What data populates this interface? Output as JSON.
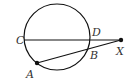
{
  "diagram": {
    "type": "circle-secant-geometry",
    "circle": {
      "cx": 57,
      "cy": 37,
      "r": 33
    },
    "points": {
      "C": {
        "label": "C",
        "x": 24,
        "y": 40,
        "lx": 16,
        "ly": 44
      },
      "D": {
        "label": "D",
        "x": 89,
        "y": 40,
        "lx": 92,
        "ly": 36
      },
      "X": {
        "label": "X",
        "x": 121,
        "y": 40,
        "lx": 116,
        "ly": 55
      },
      "B": {
        "label": "B",
        "x": 88,
        "y": 48,
        "lx": 90,
        "ly": 59
      },
      "A": {
        "label": "A",
        "x": 37,
        "y": 63,
        "lx": 26,
        "ly": 78
      }
    },
    "segments": [
      [
        "C",
        "X"
      ],
      [
        "A",
        "X"
      ]
    ],
    "dots": [
      "A",
      "X"
    ],
    "stroke_color": "#111111",
    "label_color": "#333333"
  }
}
